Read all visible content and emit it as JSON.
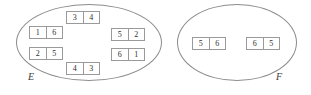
{
  "diagram": {
    "type": "venn-style-set-diagram",
    "sets": [
      {
        "id": "E",
        "label": "E",
        "tiles": [
          {
            "name": "tile-3-4",
            "left": 3,
            "right": 4
          },
          {
            "name": "tile-1-6",
            "left": 1,
            "right": 6
          },
          {
            "name": "tile-5-2",
            "left": 5,
            "right": 2
          },
          {
            "name": "tile-2-5",
            "left": 2,
            "right": 5
          },
          {
            "name": "tile-6-1",
            "left": 6,
            "right": 1
          },
          {
            "name": "tile-4-3",
            "left": 4,
            "right": 3
          }
        ]
      },
      {
        "id": "F",
        "label": "F",
        "tiles": [
          {
            "name": "tile-5-6",
            "left": 5,
            "right": 6
          },
          {
            "name": "tile-6-5",
            "left": 6,
            "right": 5
          }
        ]
      }
    ]
  },
  "colors": {
    "background": "#ffffff",
    "ellipse_stroke": "#8c8c8c",
    "tile_stroke": "#9a9a9a",
    "text": "#303030",
    "label_text": "#3b3b3b"
  }
}
